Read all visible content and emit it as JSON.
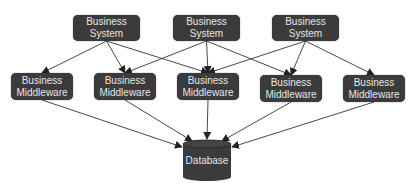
{
  "diagram": {
    "systems": [
      {
        "id": "bs1",
        "label": "Business System",
        "x": 73,
        "y": 15,
        "w": 67,
        "h": 26
      },
      {
        "id": "bs2",
        "label": "Business System",
        "x": 173,
        "y": 15,
        "w": 67,
        "h": 26
      },
      {
        "id": "bs3",
        "label": "Business System",
        "x": 272,
        "y": 15,
        "w": 67,
        "h": 26
      }
    ],
    "middleware": [
      {
        "id": "mw1",
        "line1": "Business",
        "line2": "Middleware",
        "x": 11,
        "y": 73,
        "w": 62,
        "h": 27
      },
      {
        "id": "mw2",
        "line1": "Business",
        "line2": "Middleware",
        "x": 94,
        "y": 73,
        "w": 62,
        "h": 27
      },
      {
        "id": "mw3",
        "line1": "Business",
        "line2": "Middleware",
        "x": 177,
        "y": 73,
        "w": 62,
        "h": 27
      },
      {
        "id": "mw4",
        "line1": "Business",
        "line2": "Middleware",
        "x": 260,
        "y": 75,
        "w": 62,
        "h": 27
      },
      {
        "id": "mw5",
        "line1": "Business",
        "line2": "Middleware",
        "x": 343,
        "y": 75,
        "w": 62,
        "h": 27
      }
    ],
    "database": {
      "label": "Database",
      "x": 182,
      "y": 139,
      "w": 50,
      "h": 43
    },
    "edges": [
      [
        "bs1",
        "mw1"
      ],
      [
        "bs1",
        "mw2"
      ],
      [
        "bs1",
        "mw3"
      ],
      [
        "bs2",
        "mw2"
      ],
      [
        "bs2",
        "mw3"
      ],
      [
        "bs2",
        "mw4"
      ],
      [
        "bs3",
        "mw3"
      ],
      [
        "bs3",
        "mw4"
      ],
      [
        "bs3",
        "mw5"
      ],
      [
        "mw1",
        "db"
      ],
      [
        "mw2",
        "db"
      ],
      [
        "mw3",
        "db"
      ],
      [
        "mw4",
        "db"
      ],
      [
        "mw5",
        "db"
      ]
    ],
    "colors": {
      "node_fill": "#3b3b3b",
      "node_text": "#e6e6e6",
      "edge": "#333333",
      "background": "#ffffff"
    }
  }
}
